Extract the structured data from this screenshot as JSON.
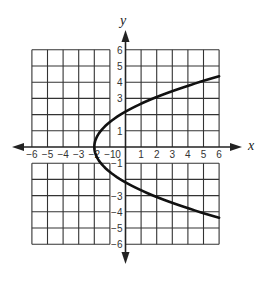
{
  "figure": {
    "x_axis_label": "x",
    "y_axis_label": "y",
    "origin_label": "0",
    "x_tick_labels": [
      {
        "value": -6,
        "label": "−6"
      },
      {
        "value": -5,
        "label": "−5"
      },
      {
        "value": -4,
        "label": "−4"
      },
      {
        "value": -3,
        "label": "−3"
      },
      {
        "value": -2,
        "label": "−2"
      },
      {
        "value": -1,
        "label": "−1"
      },
      {
        "value": 1,
        "label": "1"
      },
      {
        "value": 2,
        "label": "2"
      },
      {
        "value": 3,
        "label": "3"
      },
      {
        "value": 4,
        "label": "4"
      },
      {
        "value": 5,
        "label": "5"
      },
      {
        "value": 6,
        "label": "6"
      }
    ],
    "y_tick_labels": [
      {
        "value": 6,
        "label": "6"
      },
      {
        "value": 5,
        "label": "5"
      },
      {
        "value": 4,
        "label": "4"
      },
      {
        "value": 3,
        "label": "3"
      },
      {
        "value": 1,
        "label": "1"
      },
      {
        "value": -1,
        "label": "−1"
      },
      {
        "value": -3,
        "label": "−3"
      },
      {
        "value": -4,
        "label": "−4"
      },
      {
        "value": -5,
        "label": "−5"
      },
      {
        "value": -6,
        "label": "−6"
      }
    ],
    "grid": {
      "xmin": -6,
      "xmax": 6,
      "ymin": -6,
      "ymax": 6,
      "step": 1
    },
    "curve": {
      "type": "parabola-opening-right",
      "vertex": [
        -2,
        0
      ],
      "coefficient": 0.42,
      "equation_approx": "x = 0.42y² − 2"
    },
    "colors": {
      "grid": "#333333",
      "curve": "#111111",
      "axis": "#222222",
      "background": "#ffffff"
    }
  }
}
